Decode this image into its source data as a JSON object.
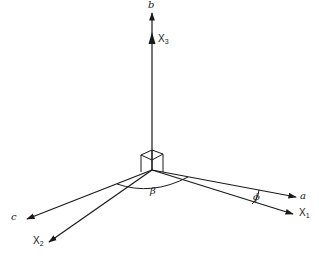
{
  "figure": {
    "colors": {
      "line": "#1a1a1a",
      "background": "#ffffff"
    },
    "axes": [
      {
        "id": "b",
        "label": "b",
        "style": "italic"
      },
      {
        "id": "x3",
        "label": "X",
        "sub": "3"
      },
      {
        "id": "a",
        "label": "a",
        "style": "italic"
      },
      {
        "id": "x1",
        "label": "X",
        "sub": "1"
      },
      {
        "id": "c",
        "label": "c",
        "style": "italic"
      },
      {
        "id": "x2",
        "label": "X",
        "sub": "2"
      }
    ],
    "angles": [
      {
        "id": "beta",
        "label": "β",
        "between": [
          "a",
          "c"
        ]
      },
      {
        "id": "phi",
        "label": "ϕ",
        "between": [
          "a",
          "X1"
        ]
      }
    ]
  }
}
